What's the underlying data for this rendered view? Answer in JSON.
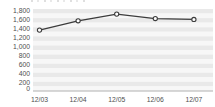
{
  "chart_data": {
    "type": "line",
    "title": "",
    "categories": [
      "12/03",
      "12/04",
      "12/05",
      "12/06",
      "12/07"
    ],
    "values": [
      1370,
      1580,
      1730,
      1630,
      1610
    ],
    "xlabel": "",
    "ylabel": "",
    "ylim": [
      0,
      1800
    ],
    "ytick_step": 200,
    "yticks": [
      {
        "value": 1800,
        "label": "1,800"
      },
      {
        "value": 1600,
        "label": "1,600"
      },
      {
        "value": 1400,
        "label": "1,400"
      },
      {
        "value": 1200,
        "label": "1,200"
      },
      {
        "value": 1000,
        "label": "1,000"
      },
      {
        "value": 800,
        "label": "800"
      },
      {
        "value": 600,
        "label": "600"
      },
      {
        "value": 400,
        "label": "400"
      },
      {
        "value": 200,
        "label": "200"
      },
      {
        "value": 0,
        "label": "0"
      }
    ],
    "legend": "none",
    "grid": "horizontal-striped-bands",
    "marker_style": "open-circle",
    "colors": {
      "line": "#3c3c3c",
      "marker_fill": "#ffffff",
      "marker_stroke": "#3c3c3c",
      "band_gray": "#e9e9e9",
      "band_light": "#f7f7f7",
      "tick_text": "#4f4f4f",
      "baseline": "#b0b0b0"
    }
  }
}
